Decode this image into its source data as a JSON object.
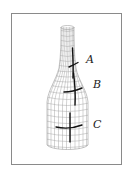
{
  "figure": {
    "labels": [
      {
        "id": "A",
        "text": "A",
        "x": 87,
        "y": 63
      },
      {
        "id": "B",
        "text": "B",
        "x": 94,
        "y": 88
      },
      {
        "id": "C",
        "text": "C",
        "x": 94,
        "y": 128
      }
    ],
    "colors": {
      "frame": "#888888",
      "mesh": "#aaaaaa",
      "marks": "#111111"
    }
  }
}
